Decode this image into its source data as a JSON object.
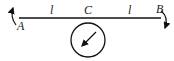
{
  "diagram": {
    "type": "beam-with-disk",
    "labels": {
      "left_end": "A",
      "right_end": "B",
      "center": "C",
      "left_span": "l",
      "right_span": "l"
    },
    "elements": [
      {
        "name": "beam",
        "from": "A",
        "to": "B"
      },
      {
        "name": "disk",
        "attached_at": "C",
        "position": "below beam"
      },
      {
        "name": "radius-arrow",
        "inside": "disk",
        "direction": "down-left"
      },
      {
        "name": "moment-arrow-A",
        "at": "A",
        "direction": "counterclockwise (upward)"
      },
      {
        "name": "moment-arrow-B",
        "at": "B",
        "direction": "clockwise (downward)"
      }
    ],
    "colors": {
      "stroke": "#111111",
      "background": "#ffffff"
    }
  }
}
